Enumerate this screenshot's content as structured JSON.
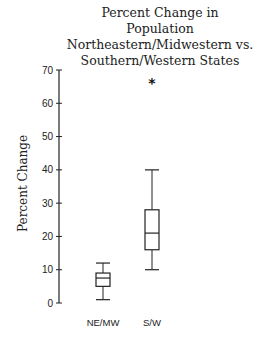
{
  "chart_data": {
    "type": "box",
    "title": "Percent Change in Population Northeastern/Midwestern vs. Southern/Western States",
    "title_lines": [
      "Percent Change in",
      "Population",
      "Northeastern/Midwestern vs.",
      "Southern/Western States"
    ],
    "xlabel": "",
    "ylabel": "Percent Change",
    "ylim": [
      0,
      70
    ],
    "yticks": [
      0,
      10,
      20,
      30,
      40,
      50,
      60,
      70
    ],
    "grid": false,
    "legend": null,
    "categories": [
      "NE/MW",
      "S/W"
    ],
    "series": [
      {
        "name": "NE/MW",
        "whisker_low": 1,
        "q1": 5,
        "median": 7.5,
        "q3": 9,
        "whisker_high": 12,
        "outliers": []
      },
      {
        "name": "S/W",
        "whisker_low": 10,
        "q1": 16,
        "median": 21,
        "q3": 28,
        "whisker_high": 40,
        "outliers": [
          66
        ]
      }
    ]
  }
}
